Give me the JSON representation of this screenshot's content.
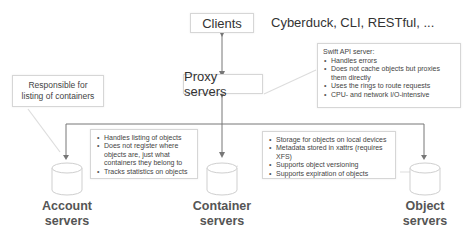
{
  "diagram": {
    "clients": {
      "label": "Clients",
      "tools_label": "Cyberduck, CLI, RESTful, ..."
    },
    "proxy": {
      "label": "Proxy servers",
      "callout": {
        "heading": "Swift API server:",
        "items": [
          "Handles errors",
          "Does not cache objects but proxies them directly",
          "Uses the rings to route requests",
          "CPU- and network I/O-intensive"
        ]
      }
    },
    "account": {
      "label_line1": "Account",
      "label_line2": "servers",
      "note": "Responsible for listing of containers"
    },
    "container": {
      "label_line1": "Container",
      "label_line2": "servers",
      "callout": {
        "items": [
          "Handles listing of objects",
          "Does not register where objects are, just what containers they belong to",
          "Tracks statistics on objects"
        ]
      }
    },
    "object": {
      "label_line1": "Object",
      "label_line2": "servers",
      "callout": {
        "items": [
          "Storage for objects on local devices",
          "Metadata stored in xattrs (requires XFS)",
          "Supports object versioning",
          "Supports expiration of objects"
        ]
      }
    },
    "colors": {
      "line": "#777777",
      "callout_connector": "#dddddd",
      "box_border": "#d6d6d6",
      "cylinder_stroke": "#cfcfcf"
    }
  }
}
